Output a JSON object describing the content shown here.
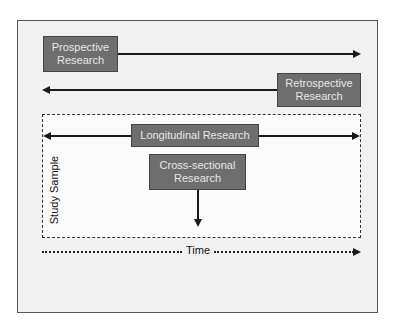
{
  "diagram": {
    "boxes": {
      "prospective": "Prospective\nResearch",
      "retrospective": "Retrospective\nResearch",
      "longitudinal": "Longitudinal Research",
      "cross_sectional": "Cross-sectional\nResearch"
    },
    "labels": {
      "study_sample": "Study Sample",
      "time": "Time"
    },
    "colors": {
      "box_fill": "#6e6e6e",
      "box_text": "#e8e8e8",
      "frame_bg": "#f1f1f1",
      "line": "#1a1a1a"
    }
  }
}
